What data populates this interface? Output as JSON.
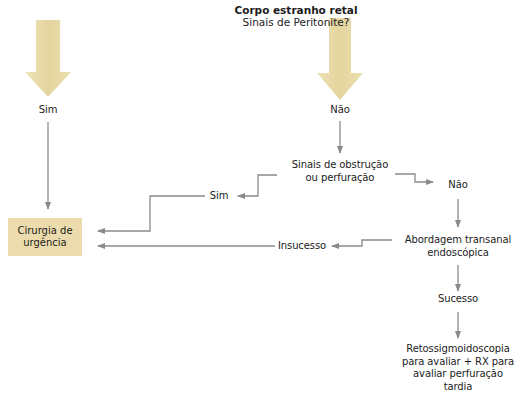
{
  "title": {
    "heading": "Corpo estranho retal",
    "question": "Sinais de Peritonite?"
  },
  "colors": {
    "arrow_fill": "#e7d9a6",
    "box_fill": "#ecdcad",
    "connector": "#8a8a8a"
  },
  "nodes": {
    "sim_left": "Sim",
    "nao_top": "Não",
    "obstruction": {
      "line1": "Sinais de obstrução",
      "line2": "ou perfuração"
    },
    "sim_mid": "Sim",
    "nao_right": "Não",
    "surgery": {
      "line1": "Cirurgia de",
      "line2": "urgência"
    },
    "failure": "Insucesso",
    "transanal": {
      "line1": "Abordagem transanal",
      "line2": "endoscópica"
    },
    "success": "Sucesso",
    "followup": {
      "line1": "Retossigmoidoscopia",
      "line2": "para avaliar + RX para",
      "line3": "avaliar perfuração",
      "line4": "tardia"
    }
  }
}
